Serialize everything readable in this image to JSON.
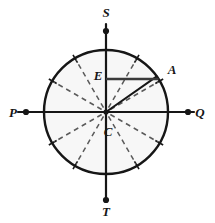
{
  "figure": {
    "kind": "geometry-diagram",
    "background_color": "#ffffff",
    "stroke_color": "#161616",
    "circle_fill": "#f7f7f7",
    "dashed_color": "#5a5a5a"
  },
  "geometry": {
    "center": {
      "x": 106,
      "y": 112
    },
    "radius": 62,
    "axis_extension": 88,
    "point_a_angle_deg": 35,
    "segment_e_y": 79
  },
  "labels": {
    "top": "S",
    "bottom": "T",
    "left": "P",
    "right": "Q",
    "center": "C",
    "chord_left": "E",
    "circle_point": "A"
  },
  "label_positions": {
    "top": {
      "x": 106,
      "y": 17
    },
    "bottom": {
      "x": 106,
      "y": 216
    },
    "left": {
      "x": 13,
      "y": 117
    },
    "right": {
      "x": 200,
      "y": 117
    },
    "center": {
      "x": 108,
      "y": 136
    },
    "chord_left": {
      "x": 98,
      "y": 80
    },
    "circle_point": {
      "x": 172,
      "y": 74
    }
  },
  "endpoint_dots": [
    {
      "name": "dot-s",
      "x": 106,
      "y": 31
    },
    {
      "name": "dot-t",
      "x": 106,
      "y": 200
    },
    {
      "name": "dot-p",
      "x": 26,
      "y": 112
    },
    {
      "name": "dot-q",
      "x": 188,
      "y": 112
    }
  ],
  "dashed_radii_angles_deg": [
    30,
    60,
    120,
    150,
    210,
    240,
    300,
    330
  ],
  "tick_angles_deg": [
    30,
    60,
    120,
    150,
    210,
    240,
    300,
    330
  ]
}
